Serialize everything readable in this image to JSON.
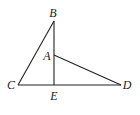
{
  "diagram": {
    "type": "geometry",
    "points": [
      {
        "id": "B",
        "label": "B",
        "x": 54,
        "y": 21,
        "lx": 53,
        "ly": 17
      },
      {
        "id": "A",
        "label": "A",
        "x": 54,
        "y": 55,
        "lx": 47,
        "ly": 60
      },
      {
        "id": "C",
        "label": "C",
        "x": 18,
        "y": 85,
        "lx": 11,
        "ly": 89
      },
      {
        "id": "E",
        "label": "E",
        "x": 54,
        "y": 85,
        "lx": 54,
        "ly": 100
      },
      {
        "id": "D",
        "label": "D",
        "x": 121,
        "y": 85,
        "lx": 127,
        "ly": 89
      }
    ],
    "segments": [
      {
        "from": "C",
        "to": "B"
      },
      {
        "from": "B",
        "to": "E"
      },
      {
        "from": "C",
        "to": "D"
      },
      {
        "from": "A",
        "to": "D"
      }
    ],
    "stroke_color": "#222222"
  }
}
